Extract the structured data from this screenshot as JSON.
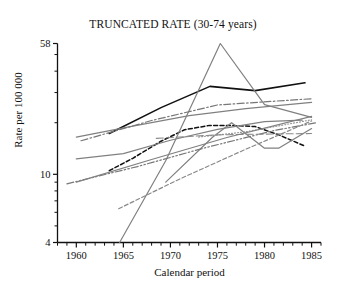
{
  "chart_data": {
    "type": "line",
    "title": "TRUNCATED RATE (30-74 years)",
    "xlabel": "Calendar period",
    "ylabel": "Rate per 100 000",
    "yscale": "log",
    "ylim": [
      4,
      58
    ],
    "xlim": [
      1958,
      1986
    ],
    "grid": false,
    "legend": "none",
    "ytick_labels": [
      "58",
      "10",
      "4"
    ],
    "ytick_values": [
      58,
      10,
      4
    ],
    "ytick_minor_values": [
      50,
      40,
      30,
      20,
      9,
      8,
      7,
      6,
      5
    ],
    "xtick_labels": [
      "1960",
      "1965",
      "1970",
      "1975",
      "1980",
      "1985"
    ],
    "xtick_values": [
      1960,
      1965,
      1970,
      1975,
      1980,
      1985
    ],
    "xtick_minor_step": 1,
    "series": [
      {
        "name": "series-1-black-solid",
        "color": "#111111",
        "style": "solid",
        "width": 1.6,
        "x": [
          1963.5,
          1969.0,
          1974.2,
          1979.0,
          1984.3
        ],
        "values": [
          17.3,
          24.5,
          32.6,
          30.8,
          34.2
        ]
      },
      {
        "name": "series-2-black-dashed",
        "color": "#111111",
        "style": "dashed",
        "width": 1.5,
        "x": [
          1963.5,
          1966.0,
          1969.0,
          1971.5,
          1974.2,
          1976.5,
          1979.0,
          1981.5,
          1984.3
        ],
        "values": [
          10.5,
          12.4,
          15.6,
          18.2,
          19.3,
          19.3,
          19.0,
          17.0,
          14.6
        ]
      },
      {
        "name": "series-3-gray-peak-solid",
        "color": "#808080",
        "style": "solid",
        "width": 1.2,
        "x": [
          1964.6,
          1969.5,
          1975.3,
          1980.0,
          1985.0
        ],
        "values": [
          4.0,
          12.0,
          58.0,
          25.5,
          21.5
        ]
      },
      {
        "name": "series-4-gray-zigzag-solid",
        "color": "#808080",
        "style": "solid",
        "width": 1.2,
        "x": [
          1969.5,
          1974.5,
          1976.5,
          1980.0,
          1981.5,
          1985.0
        ],
        "values": [
          9.0,
          16.5,
          20.0,
          14.2,
          14.2,
          18.5
        ]
      },
      {
        "name": "series-5-gray-flat-solid",
        "color": "#808080",
        "style": "solid",
        "width": 1.2,
        "x": [
          1960.0,
          1965.0,
          1970.0,
          1975.0,
          1980.0,
          1984.0
        ],
        "values": [
          12.3,
          13.2,
          15.8,
          18.3,
          20.3,
          20.7
        ]
      },
      {
        "name": "series-6-gray-rising-solid",
        "color": "#808080",
        "style": "solid",
        "width": 1.2,
        "x": [
          1960.0,
          1966.0,
          1972.0,
          1978.0,
          1985.0
        ],
        "values": [
          16.5,
          19.1,
          22.0,
          24.2,
          26.3
        ]
      },
      {
        "name": "series-7-gray-dashdot-upper",
        "color": "#777777",
        "style": "dashdot",
        "width": 1.2,
        "x": [
          1960.5,
          1968.0,
          1975.0,
          1985.0
        ],
        "values": [
          15.7,
          20.6,
          25.4,
          27.6
        ]
      },
      {
        "name": "series-8-gray-dashdotdot",
        "color": "#777777",
        "style": "dashdotdot",
        "width": 1.2,
        "x": [
          1959.0,
          1966.5,
          1973.5,
          1981.0,
          1985.5
        ],
        "values": [
          8.8,
          11.1,
          14.2,
          18.0,
          20.0
        ]
      },
      {
        "name": "series-9-gray-dashed-low",
        "color": "#888888",
        "style": "dashed",
        "width": 1.2,
        "x": [
          1964.5,
          1971.0,
          1978.0,
          1985.0
        ],
        "values": [
          6.3,
          9.4,
          14.0,
          20.5
        ]
      },
      {
        "name": "series-10-gray-dotted",
        "color": "#999999",
        "style": "dotted",
        "width": 1.2,
        "x": [
          1973.0,
          1978.0,
          1982.0,
          1985.0
        ],
        "values": [
          16.5,
          17.7,
          19.4,
          20.8
        ]
      },
      {
        "name": "series-11-gray-flatline",
        "color": "#8a8a8a",
        "style": "dashed-long",
        "width": 1.1,
        "x": [
          1968.5,
          1975.0,
          1981.0,
          1985.0
        ],
        "values": [
          16.2,
          17.0,
          17.2,
          17.3
        ]
      },
      {
        "name": "series-12-gray-steep-solid",
        "color": "#808080",
        "style": "solid",
        "width": 1.2,
        "x": [
          1960.0,
          1968.0,
          1976.0,
          1985.0
        ],
        "values": [
          9.0,
          12.2,
          16.4,
          21.8
        ]
      }
    ]
  },
  "axes": {
    "y_label": "Rate per 100 000",
    "x_label": "Calendar period",
    "y_top_label": "58",
    "y_mid_label": "10",
    "y_bottom_label": "4"
  }
}
